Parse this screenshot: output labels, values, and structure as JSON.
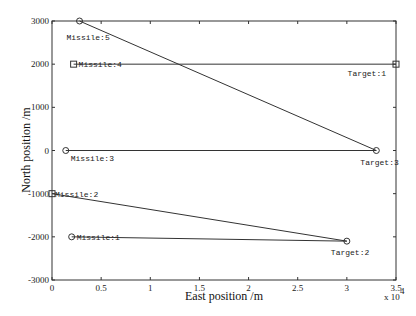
{
  "chart_data": {
    "type": "line",
    "title": "",
    "xlabel": "East position /m",
    "ylabel": "North position /m",
    "x_multiplier_label": "x 10",
    "x_multiplier_exponent": "4",
    "xlim": [
      0,
      35000
    ],
    "ylim": [
      -3000,
      3000
    ],
    "xticks": [
      0,
      5000,
      10000,
      15000,
      20000,
      25000,
      30000,
      35000
    ],
    "xtick_labels": [
      "0",
      "0.5",
      "1",
      "1.5",
      "2",
      "2.5",
      "3",
      "3.5"
    ],
    "yticks": [
      -3000,
      -2000,
      -1000,
      0,
      1000,
      2000,
      3000
    ],
    "ytick_labels": [
      "-3000",
      "-2000",
      "-1000",
      "0",
      "1000",
      "2000",
      "3000"
    ],
    "grid": false,
    "legend": null,
    "targets": [
      {
        "name": "Target:1",
        "x": 35000,
        "y": 2000,
        "marker": "square"
      },
      {
        "name": "Target:2",
        "x": 30000,
        "y": -2100,
        "marker": "circle"
      },
      {
        "name": "Target:3",
        "x": 33000,
        "y": 0,
        "marker": "circle"
      }
    ],
    "series": [
      {
        "name": "Missile:1",
        "marker": "circle",
        "start": {
          "x": 2000,
          "y": -2000
        },
        "target": "Target:2",
        "end": {
          "x": 30000,
          "y": -2100
        }
      },
      {
        "name": "Missile:2",
        "marker": "square",
        "start": {
          "x": 0,
          "y": -1000
        },
        "target": "Target:2",
        "end": {
          "x": 30000,
          "y": -2100
        }
      },
      {
        "name": "Missile:3",
        "marker": "circle",
        "start": {
          "x": 1400,
          "y": 0
        },
        "target": "Target:3",
        "end": {
          "x": 33000,
          "y": 0
        }
      },
      {
        "name": "Missile:4",
        "marker": "square",
        "start": {
          "x": 2200,
          "y": 2000
        },
        "target": "Target:1",
        "end": {
          "x": 35000,
          "y": 2000
        }
      },
      {
        "name": "Missile:5",
        "marker": "circle",
        "start": {
          "x": 2800,
          "y": 3000
        },
        "target": "Target:3",
        "end": {
          "x": 33000,
          "y": 0
        }
      }
    ],
    "label_offsets": {
      "Missile:1": [
        5,
        3,
        "start"
      ],
      "Missile:2": [
        3,
        3,
        "start"
      ],
      "Missile:3": [
        5,
        10,
        "start"
      ],
      "Missile:4": [
        5,
        3,
        "start"
      ],
      "Missile:5": [
        -13,
        19,
        "start"
      ],
      "Target:1": [
        -10,
        12,
        "end"
      ],
      "Target:2": [
        -16,
        14,
        "start"
      ],
      "Target:3": [
        -16,
        14,
        "start"
      ]
    }
  },
  "layout": {
    "plot_left": 52,
    "plot_right": 396,
    "plot_top": 21,
    "plot_bottom": 280
  }
}
